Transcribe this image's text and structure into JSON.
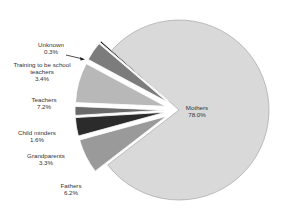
{
  "chart_data": {
    "type": "pie",
    "title": "",
    "exploded": true,
    "slices": [
      {
        "label": "Mothers",
        "value": 78.0,
        "display": "78.0%",
        "color": "#d9d9d9",
        "explode": 0
      },
      {
        "label": "Fathers",
        "value": 6.2,
        "display": "6.2%",
        "color": "#9a9a9a",
        "explode": 14
      },
      {
        "label": "Grandparents",
        "value": 3.3,
        "display": "3.3%",
        "color": "#2b2b2b",
        "explode": 14
      },
      {
        "label": "Child minders",
        "value": 1.6,
        "display": "1.6%",
        "color": "#6a6a6a",
        "explode": 14
      },
      {
        "label": "Teachers",
        "value": 7.2,
        "display": "7.2%",
        "color": "#b8b8b8",
        "explode": 14
      },
      {
        "label": "Training to be school teachers",
        "value": 3.4,
        "display": "3.4%",
        "color": "#7c7c7c",
        "explode": 14
      },
      {
        "label": "Unknown",
        "value": 0.3,
        "display": "0.3%",
        "color": "#111111",
        "explode": 14
      }
    ]
  },
  "labels": {
    "mothers": {
      "name": "Mothers",
      "pct": "78.0%"
    },
    "fathers": {
      "name": "Fathers",
      "pct": "6.2%"
    },
    "grandparents": {
      "name": "Grandparents",
      "pct": "3.3%"
    },
    "childminders": {
      "name": "Child minders",
      "pct": "1.6%"
    },
    "teachers": {
      "name": "Teachers",
      "pct": "7.2%"
    },
    "training": {
      "line1": "Training to be school",
      "line2": "teachers",
      "pct": "3.4%"
    },
    "unknown": {
      "name": "Unknown",
      "pct": "0.3%"
    }
  }
}
